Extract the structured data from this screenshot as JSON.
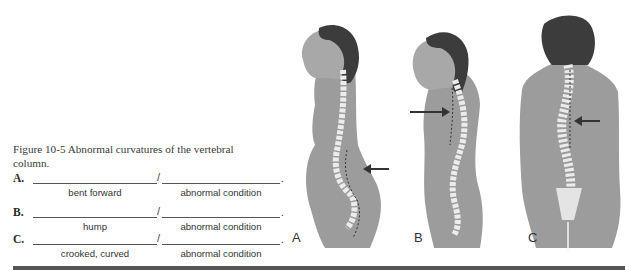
{
  "figure": {
    "caption": "Figure 10-5  Abnormal curvatures of the vertebral column.",
    "items": [
      {
        "letter": "A.",
        "hint_root": "bent forward",
        "hint_suffix": "abnormal condition",
        "value_root": "",
        "value_suffix": ""
      },
      {
        "letter": "B.",
        "hint_root": "hump",
        "hint_suffix": "abnormal condition",
        "value_root": "",
        "value_suffix": ""
      },
      {
        "letter": "C.",
        "hint_root": "crooked, curved",
        "hint_suffix": "abnormal condition",
        "value_root": "",
        "value_suffix": ""
      }
    ],
    "separator": "/",
    "terminator": ".",
    "panels": [
      {
        "label": "A",
        "view": "side",
        "condition_arrow": "lumbar, pointing left"
      },
      {
        "label": "B",
        "view": "side",
        "condition_arrow": "thoracic, pointing right"
      },
      {
        "label": "C",
        "view": "back",
        "condition_arrow": "thoracic, pointing left"
      }
    ]
  },
  "colors": {
    "skin": "#9a9a9a",
    "hair": "#3a3a3a",
    "spine": "#e8e8e8",
    "rule": "#555555"
  }
}
